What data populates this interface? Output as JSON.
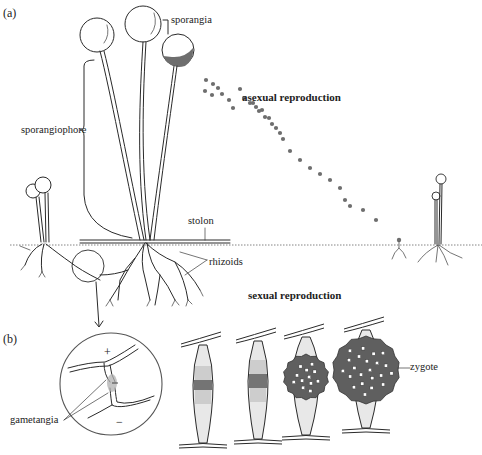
{
  "figure": {
    "colors": {
      "ink": "#2a2a2a",
      "spore": "#6e6e6e",
      "zygote": "#5f5f5f",
      "stipple": "#9a9a9a",
      "background": "#ffffff"
    }
  },
  "panel_a": {
    "label": "(a)",
    "heading": "asexual reproduction",
    "labels": {
      "sporangia": "sporangia",
      "sporangiophore": "sporangiophore",
      "stolon": "stolon",
      "rhizoids": "rhizoids"
    },
    "spores_dispersal": [
      [
        240,
        89
      ],
      [
        244,
        98
      ],
      [
        250,
        103
      ],
      [
        253,
        103
      ],
      [
        256,
        107
      ],
      [
        259,
        111
      ],
      [
        262,
        110
      ],
      [
        265,
        117
      ],
      [
        269,
        118
      ],
      [
        272,
        124
      ],
      [
        276,
        128
      ],
      [
        280,
        133
      ],
      [
        283,
        139
      ],
      [
        290,
        151
      ],
      [
        300,
        160
      ],
      [
        310,
        168
      ],
      [
        320,
        174
      ],
      [
        330,
        180
      ],
      [
        340,
        188
      ],
      [
        345,
        200
      ],
      [
        350,
        206
      ],
      [
        363,
        210
      ],
      [
        376,
        220
      ],
      [
        206,
        80
      ],
      [
        213,
        84
      ],
      [
        218,
        88
      ],
      [
        222,
        94
      ],
      [
        229,
        100
      ],
      [
        233,
        108
      ],
      [
        205,
        91
      ],
      [
        212,
        95
      ]
    ]
  },
  "panel_b": {
    "label": "(b)",
    "heading": "sexual reproduction",
    "labels": {
      "gametangia": "gametangia",
      "zygote": "zygote",
      "plus_strain": "+",
      "minus_strain": "−"
    },
    "stages": [
      {
        "name": "gametangia-contact",
        "cx": 203,
        "cy": 385,
        "zygote_r": 0,
        "band_h": 10
      },
      {
        "name": "fusion",
        "cx": 258,
        "cy": 381,
        "zygote_r": 0,
        "band_h": 14
      },
      {
        "name": "young-zygote",
        "cx": 306,
        "cy": 377,
        "zygote_r": 21
      },
      {
        "name": "mature-zygote",
        "cx": 366,
        "cy": 370,
        "zygote_r": 32
      }
    ]
  }
}
